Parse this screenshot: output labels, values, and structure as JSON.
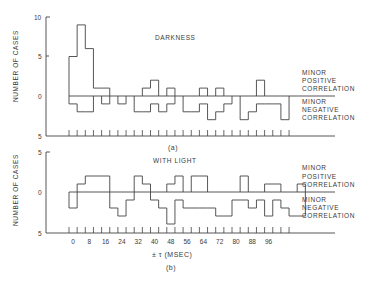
{
  "figure": {
    "panel_a_caption": "(a)",
    "panel_b_caption": "(b)",
    "x_axis_label": "± τ (MSEC)"
  },
  "chart_data": [
    {
      "type": "bar",
      "title": "DARKNESS",
      "panel": "(a)",
      "ylabel": "NUMBER OF CASES",
      "xlabel": "",
      "ytick_labels": [
        "10",
        "5",
        "0",
        "5"
      ],
      "ylim_positive": [
        0,
        10
      ],
      "ylim_negative": [
        0,
        5
      ],
      "bin_width_msec": 4,
      "annotations": [
        "MINOR POSITIVE CORRELATION",
        "MINOR NEGATIVE CORRELATION"
      ],
      "series": [
        {
          "name": "Minor positive correlation",
          "values": [
            5,
            9,
            6,
            1,
            1,
            0,
            0,
            0,
            0,
            1,
            2,
            0,
            1,
            0,
            0,
            0,
            1,
            0,
            1,
            0,
            0,
            0,
            0,
            2,
            0,
            0,
            0
          ]
        },
        {
          "name": "Minor negative correlation",
          "values": [
            1,
            2,
            2,
            0,
            1,
            0,
            1,
            0,
            2,
            2,
            1,
            2,
            1,
            0,
            2,
            2,
            1,
            3,
            2,
            1,
            0,
            3,
            2,
            1,
            1,
            1,
            3
          ]
        }
      ],
      "grid": false
    },
    {
      "type": "bar",
      "title": "WITH LIGHT",
      "panel": "(b)",
      "ylabel": "NUMBER OF CASES",
      "xlabel": "± τ (MSEC)",
      "ytick_labels": [
        "5",
        "0",
        "5"
      ],
      "ylim_positive": [
        0,
        5
      ],
      "ylim_negative": [
        0,
        5
      ],
      "bin_width_msec": 4,
      "xtick_labels": [
        "0",
        "8",
        "16",
        "24",
        "32",
        "40",
        "48",
        "56",
        "64",
        "72",
        "80",
        "88",
        "96"
      ],
      "annotations": [
        "MINOR POSITIVE CORRELATION",
        "MINOR NEGATIVE CORRELATION"
      ],
      "series": [
        {
          "name": "Minor positive correlation",
          "values": [
            0,
            1,
            2,
            2,
            2,
            0,
            0,
            0,
            2,
            1,
            0,
            0,
            1,
            2,
            0,
            2,
            2,
            0,
            0,
            0,
            0,
            2,
            0,
            0,
            1,
            1,
            0,
            0,
            1
          ]
        },
        {
          "name": "Minor negative correlation",
          "values": [
            2,
            0,
            0,
            0,
            0,
            2,
            3,
            1,
            0,
            0,
            1,
            2,
            4,
            1,
            2,
            2,
            2,
            2,
            3,
            3,
            1,
            1,
            2,
            1,
            3,
            1,
            2,
            3,
            3
          ]
        }
      ],
      "grid": false
    }
  ],
  "labels": {
    "darkness": "DARKNESS",
    "with_light": "WITH LIGHT",
    "ylabel": "NUMBER OF CASES",
    "minor": "MINOR",
    "positive": "POSITIVE",
    "negative": "NEGATIVE",
    "correlation": "CORRELATION",
    "y10": "10",
    "y5": "5",
    "y0": "0"
  }
}
